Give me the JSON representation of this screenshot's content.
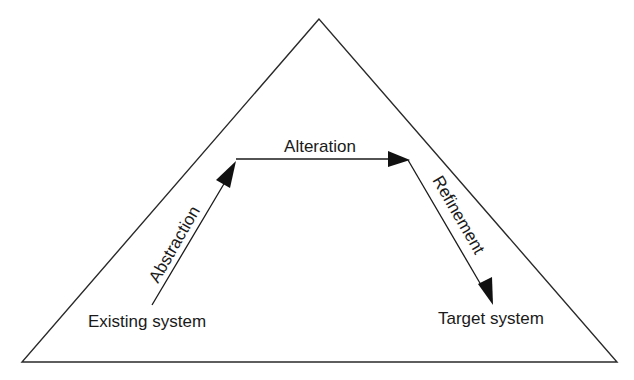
{
  "diagram": {
    "type": "triangle-process",
    "nodes": {
      "start": "Existing system",
      "end": "Target system"
    },
    "edges": {
      "abstraction": "Abstraction",
      "alteration": "Alteration",
      "refinement": "Refinement"
    },
    "colors": {
      "line": "#2a2a2a",
      "text": "#1a1a1a",
      "background": "#ffffff"
    }
  }
}
